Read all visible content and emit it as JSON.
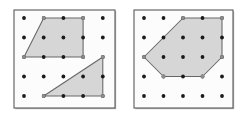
{
  "figure": {
    "title": "",
    "caption": "",
    "background_color": "#ffffff",
    "panel_count": 2,
    "grid_rows": 5,
    "grid_cols": 5,
    "dot_color": "#1a1a1a",
    "dot_radius": 1.9,
    "panel_border_color": "#5a5a5a",
    "panel_fill_color": "#fcfcfc",
    "polygon_fill_color": "#d4d4d4",
    "polygon_stroke_color": "#666666",
    "vertex_marker_color": "#8c8c8c"
  },
  "panels": [
    {
      "id": "left-panel",
      "label": "Left geoboard",
      "x": 14,
      "y": 10,
      "width": 101,
      "height": 98,
      "origin_x": 24,
      "origin_y": 18,
      "step_x": 19.7,
      "step_y": 19.5,
      "shapes": [
        {
          "id": "trapezoid",
          "label": "Trapezoid",
          "type": "polygon",
          "sides": 4,
          "grid_points": [
            [
              1,
              0
            ],
            [
              3,
              0
            ],
            [
              3,
              2
            ],
            [
              0,
              2
            ]
          ],
          "vertex_count": 4
        },
        {
          "id": "right-triangle",
          "label": "Right triangle",
          "type": "polygon",
          "sides": 3,
          "grid_points": [
            [
              1,
              4
            ],
            [
              4,
              4
            ],
            [
              4,
              2
            ]
          ],
          "vertex_count": 3
        }
      ]
    },
    {
      "id": "right-panel",
      "label": "Right geoboard",
      "x": 134,
      "y": 10,
      "width": 99,
      "height": 98,
      "origin_x": 144,
      "origin_y": 18,
      "step_x": 19.5,
      "step_y": 19.5,
      "shapes": [
        {
          "id": "hexagon",
          "label": "Hexagon",
          "type": "polygon",
          "sides": 6,
          "grid_points": [
            [
              2,
              0
            ],
            [
              4,
              0
            ],
            [
              4,
              2
            ],
            [
              3,
              3
            ],
            [
              1,
              3
            ],
            [
              0,
              2
            ]
          ],
          "vertex_count": 6
        }
      ]
    }
  ]
}
